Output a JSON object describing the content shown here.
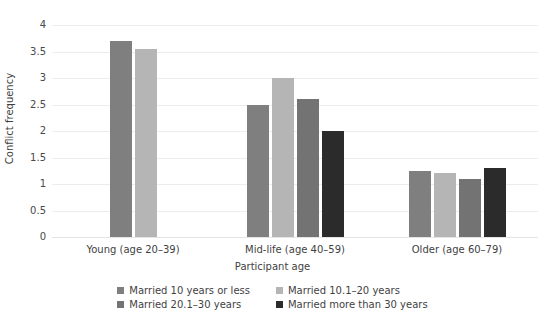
{
  "chart_data": {
    "type": "bar",
    "title": "",
    "xlabel": "Participant age",
    "ylabel": "Conflict frequency",
    "ylim": [
      0,
      4
    ],
    "yticks": [
      "0",
      "0.5",
      "1",
      "1.5",
      "2",
      "2.5",
      "3",
      "3.5",
      "4"
    ],
    "grid": true,
    "legend_position": "bottom",
    "categories": [
      "Young (age 20–39)",
      "Mid-life (age 40–59)",
      "Older (age 60–79)"
    ],
    "series": [
      {
        "name": "Married 10 years or less",
        "color": "#7f7f7f",
        "values": [
          3.7,
          2.5,
          1.25
        ]
      },
      {
        "name": "Married 10.1–20 years",
        "color": "#b5b5b5",
        "values": [
          3.55,
          3.0,
          1.2
        ]
      },
      {
        "name": "Married 20.1–30 years",
        "color": "#737373",
        "values": [
          null,
          2.6,
          1.1
        ]
      },
      {
        "name": "Married more than 30 years",
        "color": "#2b2b2b",
        "values": [
          null,
          2.0,
          1.3
        ]
      }
    ]
  },
  "colors": {
    "gridline": "#ededed",
    "text": "#3f3f3f",
    "background": "#ffffff"
  }
}
